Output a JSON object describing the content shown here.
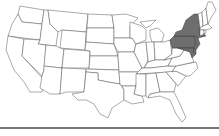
{
  "map": {
    "type": "US states choropleth",
    "highlight_color": "#6e6e6e",
    "base_color": "#ffffff",
    "border_color": "#444444",
    "highlighted_states": [
      "New York",
      "Pennsylvania",
      "New Jersey",
      "Delaware",
      "Maryland"
    ]
  },
  "footer": {
    "rule_color": "#777777"
  }
}
